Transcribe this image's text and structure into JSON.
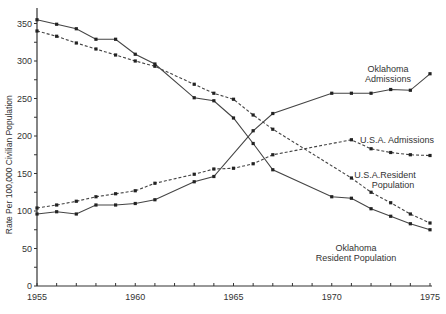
{
  "chart_data": {
    "type": "line",
    "title": "",
    "xlabel": "",
    "ylabel": "Rate Per 100,000 Civilian Population",
    "xlim": [
      1955,
      1975
    ],
    "ylim": [
      0,
      350
    ],
    "x_ticks": [
      1955,
      1956,
      1957,
      1958,
      1959,
      1960,
      1961,
      1962,
      1963,
      1964,
      1965,
      1966,
      1967,
      1968,
      1969,
      1970,
      1971,
      1972,
      1973,
      1974,
      1975
    ],
    "x_tick_labels": [
      "1955",
      "1960",
      "1965",
      "1970",
      "1975"
    ],
    "x_tick_label_values": [
      1955,
      1960,
      1965,
      1970,
      1975
    ],
    "y_ticks": [
      0,
      25,
      50,
      75,
      100,
      125,
      150,
      175,
      200,
      225,
      250,
      275,
      300,
      325,
      350
    ],
    "y_tick_labels": [
      "0",
      "50",
      "100",
      "150",
      "200",
      "250",
      "300",
      "350"
    ],
    "y_tick_label_values": [
      0,
      50,
      100,
      150,
      200,
      250,
      300,
      350
    ],
    "grid": false,
    "series": [
      {
        "name": "Oklahoma Resident Population",
        "style": "solid",
        "x": [
          1955,
          1956,
          1957,
          1958,
          1959,
          1960,
          1961,
          1963,
          1964,
          1965,
          1966,
          1967,
          1970,
          1971,
          1972,
          1973,
          1974,
          1975
        ],
        "values": [
          355,
          349,
          343,
          329,
          329,
          309,
          296,
          251,
          247,
          224,
          190,
          155,
          119,
          117,
          103,
          93,
          83,
          75
        ],
        "label_lines": [
          "Oklahoma",
          "Resident Population"
        ]
      },
      {
        "name": "U.S.A. Resident Population",
        "style": "dashed",
        "x": [
          1955,
          1956,
          1957,
          1958,
          1959,
          1960,
          1961,
          1963,
          1964,
          1965,
          1966,
          1967,
          1971,
          1972,
          1973,
          1974,
          1975
        ],
        "values": [
          340,
          333,
          324,
          316,
          308,
          300,
          293,
          269,
          257,
          249,
          228,
          209,
          144,
          125,
          111,
          96,
          84
        ],
        "label_lines": [
          "U.S.A.Resident",
          "Population"
        ]
      },
      {
        "name": "Oklahoma Admissions",
        "style": "solid",
        "x": [
          1955,
          1956,
          1957,
          1958,
          1959,
          1960,
          1961,
          1963,
          1964,
          1966,
          1967,
          1970,
          1971,
          1972,
          1973,
          1974,
          1975
        ],
        "values": [
          96,
          99,
          96,
          108,
          108,
          110,
          115,
          139,
          146,
          207,
          230,
          257,
          257,
          257,
          262,
          261,
          283
        ],
        "label_lines": [
          "Oklahoma",
          "Admissions"
        ]
      },
      {
        "name": "U.S.A. Admissions",
        "style": "dashed",
        "x": [
          1955,
          1956,
          1957,
          1958,
          1959,
          1960,
          1961,
          1963,
          1964,
          1965,
          1966,
          1967,
          1971,
          1972,
          1973,
          1974,
          1975
        ],
        "values": [
          104,
          108,
          113,
          119,
          123,
          127,
          137,
          149,
          156,
          157,
          163,
          175,
          195,
          183,
          178,
          175,
          174
        ],
        "label_lines": [
          "U.S.A.  Admissions"
        ]
      }
    ],
    "legend": "inline labels at right end of each line"
  }
}
